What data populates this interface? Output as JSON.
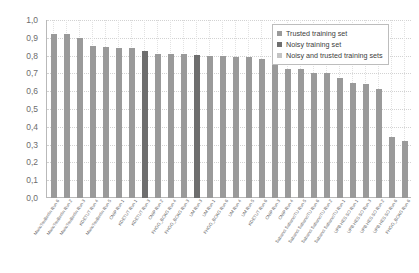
{
  "chart_data": {
    "type": "bar",
    "title": "",
    "subtitle": "",
    "xlabel": "",
    "ylabel": "",
    "ylim": [
      0.0,
      1.0
    ],
    "grid": true,
    "legend_position": "top-right",
    "y_ticks": [
      "0,0",
      "0,1",
      "0,2",
      "0,3",
      "0,4",
      "0,5",
      "0,6",
      "0,7",
      "0,8",
      "0,9",
      "1,0"
    ],
    "y_tick_values": [
      0.0,
      0.1,
      0.2,
      0.3,
      0.4,
      0.5,
      0.6,
      0.7,
      0.8,
      0.9,
      1.0
    ],
    "decimal_separator": ",",
    "legend": [
      {
        "name": "Trusted training set",
        "color": "#9a9a9a"
      },
      {
        "name": "Noisy training set",
        "color": "#6e6e6e"
      },
      {
        "name": "Noisy and trusted training sets",
        "color": "#c4c4c4"
      }
    ],
    "categories": [
      "MarioTsuBerlin Run 6",
      "MarioTsuBerlin Run 2",
      "MarioTsuBerlin Run 3",
      "KDETUT Run 4",
      "MarioTsuBerlin Run 5",
      "CNIP Run 1",
      "KDETUT Run 1",
      "KDETUT Run 3",
      "CNIP Run 2",
      "FHGG_BCKG Run 4",
      "FHGG_BCKG Run 3",
      "UM Run 3",
      "UM Run 1",
      "FHGG_BCKG Run 6",
      "UM Run 4",
      "UM Run 5",
      "KDETUT Run 6",
      "CNIP Run 3",
      "CNIP Run 4",
      "Sabanci SabanciTU Run 5",
      "Sabanci SabanciTU Run 6",
      "Sabanci SabanciTU Run 2",
      "Sabanci SabanciTU Run 1",
      "UPB HES SO Run 1",
      "UPB HES SO Run 3",
      "UPB HES SO Run 2",
      "UPB HES SO Run 6",
      "FHGG_BCKG Run 6"
    ],
    "values": [
      0.92,
      0.92,
      0.9,
      0.855,
      0.85,
      0.845,
      0.84,
      0.825,
      0.81,
      0.81,
      0.81,
      0.805,
      0.8,
      0.8,
      0.795,
      0.79,
      0.78,
      0.765,
      0.725,
      0.725,
      0.705,
      0.7,
      0.675,
      0.645,
      0.64,
      0.61,
      0.345,
      0.32
    ],
    "series_assignment": [
      "trusted",
      "trusted",
      "trusted",
      "trusted",
      "trusted",
      "trusted",
      "trusted",
      "noisy",
      "trusted",
      "trusted",
      "trusted",
      "noisy",
      "trusted",
      "trusted",
      "trusted",
      "trusted",
      "trusted",
      "trusted",
      "trusted",
      "trusted",
      "trusted",
      "trusted",
      "trusted",
      "trusted",
      "trusted",
      "trusted",
      "trusted",
      "trusted"
    ]
  }
}
